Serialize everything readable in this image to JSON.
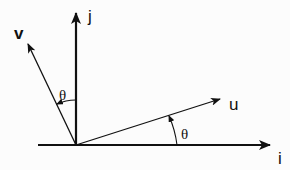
{
  "diagram": {
    "title": "",
    "labels": {
      "i_axis": "i",
      "j_axis": "j",
      "u_vector": "u",
      "v_vector": "v",
      "theta_u": "θ",
      "theta_v": "θ"
    },
    "colors": {
      "stroke": "#111111",
      "background": "#fcfcfc"
    },
    "geometry": {
      "origin": [
        76,
        145
      ],
      "i_axis_end": [
        270,
        145
      ],
      "i_axis_start": [
        38,
        145
      ],
      "j_axis_end": [
        76,
        13
      ],
      "u_tip": [
        220,
        99
      ],
      "v_tip": [
        28,
        44
      ]
    }
  }
}
